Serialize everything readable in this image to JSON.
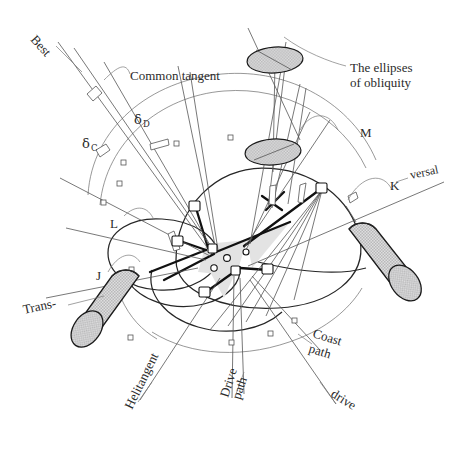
{
  "figure": {
    "width": 464,
    "height": 456,
    "background_color": "#ffffff",
    "line_color": "#2b2b2b",
    "accent_fill": "#d9d9d9"
  },
  "labels": {
    "best": "Best",
    "common_tangent": "Common tangent",
    "delta_c_symbol": "δ",
    "delta_c_sub": "C",
    "delta_d_symbol": "δ",
    "delta_d_sub": "D",
    "ellipses_line1": "The ellipses",
    "ellipses_line2": "of obliquity",
    "m": "M",
    "k": "K",
    "versal": "versal",
    "l": "L",
    "j": "J",
    "trans": "Trans-",
    "helitangent": "Helitangent",
    "drive_line1": "Drive",
    "drive_line2": "path",
    "coast_line1": "Coast",
    "coast_line2": "path",
    "drive": "drive"
  },
  "parts": {
    "cylinder_left_name": "left-cylinder",
    "cylinder_right_name": "right-cylinder",
    "ellipse_upper_name": "upper-obliquity-ellipse",
    "ellipse_lower_name": "lower-obliquity-ellipse",
    "hub_name": "central-hub"
  }
}
